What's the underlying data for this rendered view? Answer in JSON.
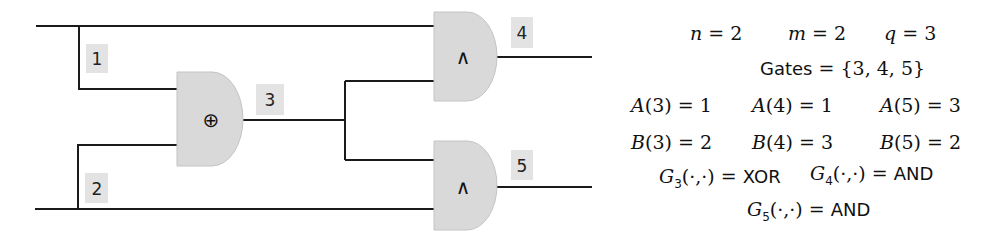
{
  "diagram": {
    "inputs": [
      {
        "id": 1,
        "label": "1"
      },
      {
        "id": 2,
        "label": "2"
      }
    ],
    "gates": [
      {
        "id": 3,
        "label": "3",
        "symbol": "⊕",
        "type": "XOR",
        "in_a": 1,
        "in_b": 2
      },
      {
        "id": 4,
        "label": "4",
        "symbol": "∧",
        "type": "AND",
        "in_a": 1,
        "in_b": 3
      },
      {
        "id": 5,
        "label": "5",
        "symbol": "∧",
        "type": "AND",
        "in_a": 3,
        "in_b": 2
      }
    ],
    "colors": {
      "wire": "#1a1a1a",
      "gate_fill": "#d9d9d9",
      "label_box": "#e3e3e3"
    }
  },
  "params": {
    "n": {
      "var": "n",
      "value": "2"
    },
    "m": {
      "var": "m",
      "value": "2"
    },
    "q": {
      "var": "q",
      "value": "3"
    },
    "gates_set": {
      "name": "Gates",
      "value": "{3, 4, 5}"
    }
  },
  "A": [
    {
      "fn": "A",
      "arg": "3",
      "value": "1"
    },
    {
      "fn": "A",
      "arg": "4",
      "value": "1"
    },
    {
      "fn": "A",
      "arg": "5",
      "value": "3"
    }
  ],
  "B": [
    {
      "fn": "B",
      "arg": "3",
      "value": "2"
    },
    {
      "fn": "B",
      "arg": "4",
      "value": "3"
    },
    {
      "fn": "B",
      "arg": "5",
      "value": "2"
    }
  ],
  "G": [
    {
      "fn": "G",
      "sub": "3",
      "args": "(·,·)",
      "value": "XOR"
    },
    {
      "fn": "G",
      "sub": "4",
      "args": "(·,·)",
      "value": "AND"
    },
    {
      "fn": "G",
      "sub": "5",
      "args": "(·,·)",
      "value": "AND"
    }
  ],
  "symbols": {
    "eq": "=",
    "lparen": "(",
    "rparen": ")"
  }
}
